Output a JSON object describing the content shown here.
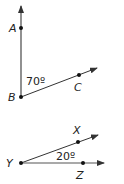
{
  "figure1": {
    "vertex_label": "B",
    "point_a_label": "A",
    "point_c_label": "C",
    "angle_label": "70º",
    "angle_degrees": 70
  },
  "figure2": {
    "vertex_label": "Y",
    "point_x_label": "X",
    "point_z_label": "Z",
    "angle_label": "20º",
    "angle_degrees": 20
  },
  "colors": {
    "line": "#333333",
    "text": "#222222"
  }
}
